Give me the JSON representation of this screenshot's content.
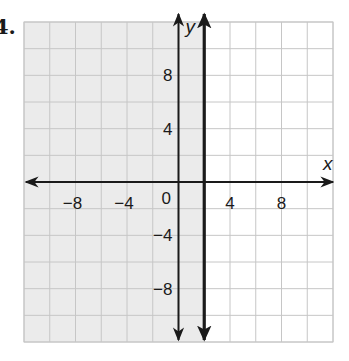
{
  "problem": {
    "number": "4."
  },
  "chart_data": {
    "type": "inequality-graph",
    "title": "",
    "xlabel": "x",
    "ylabel": "y",
    "xlim": [
      -12,
      12
    ],
    "ylim": [
      -12,
      12
    ],
    "grid": true,
    "grid_step": 2,
    "x_tick_labels": [
      "−8",
      "−4",
      "4",
      "8"
    ],
    "x_tick_values": [
      -8,
      -4,
      4,
      8
    ],
    "y_tick_labels": [
      "8",
      "4",
      "−4",
      "−8"
    ],
    "y_tick_values": [
      8,
      4,
      -4,
      -8
    ],
    "origin_label": "0",
    "boundary": {
      "equation": "x = 2",
      "style": "solid",
      "x": 2
    },
    "shaded_region": "x ≤ 2",
    "shade_side": "left",
    "colors": {
      "shade": "#ebebeb",
      "grid": "#c6c6c6",
      "lines": "#1a1a1a",
      "background": "#ffffff"
    }
  }
}
